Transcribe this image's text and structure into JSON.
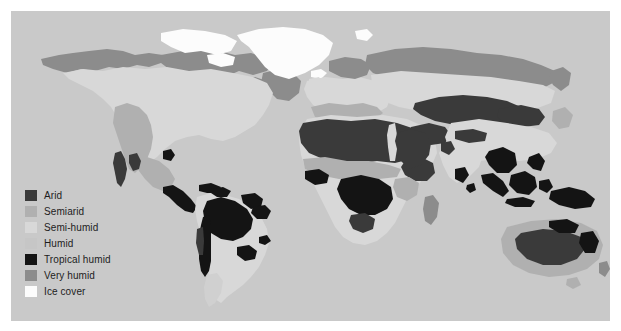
{
  "figure": {
    "kind": "world-climate-aridity-map",
    "projection": "equirectangular",
    "background_color": "#ffffff",
    "ocean_color": "#c9c9c9",
    "width": 621,
    "height": 331
  },
  "legend": {
    "title": "",
    "position": "bottom-left",
    "items": [
      {
        "label": "Arid",
        "color": "#3a3a3a"
      },
      {
        "label": "Semiarid",
        "color": "#b0b0b0"
      },
      {
        "label": "Semi-humid",
        "color": "#d8d8d8"
      },
      {
        "label": "Humid",
        "color": "#c6c6c6"
      },
      {
        "label": "Tropical humid",
        "color": "#141414"
      },
      {
        "label": "Very humid",
        "color": "#8c8c8c"
      },
      {
        "label": "Ice cover",
        "color": "#fcfcfc"
      }
    ]
  },
  "map_regions": [
    {
      "name": "greenland-ice-cover",
      "class_label": "Ice cover",
      "color": "#fcfcfc"
    },
    {
      "name": "arctic-archipelago-ice",
      "class_label": "Ice cover",
      "color": "#fcfcfc"
    },
    {
      "name": "siberian-tundra-belt",
      "class_label": "Very humid",
      "color": "#8c8c8c"
    },
    {
      "name": "canadian-tundra-belt",
      "class_label": "Very humid",
      "color": "#8c8c8c"
    },
    {
      "name": "alaska-boreal",
      "class_label": "Very humid",
      "color": "#8c8c8c"
    },
    {
      "name": "north-america-interior",
      "class_label": "Semi-humid",
      "color": "#d8d8d8"
    },
    {
      "name": "great-basin-southwest-arid",
      "class_label": "Semiarid",
      "color": "#b0b0b0"
    },
    {
      "name": "baja-california-arid",
      "class_label": "Arid",
      "color": "#3a3a3a"
    },
    {
      "name": "central-america-tropical",
      "class_label": "Tropical humid",
      "color": "#141414"
    },
    {
      "name": "amazon-basin",
      "class_label": "Tropical humid",
      "color": "#141414"
    },
    {
      "name": "guiana-tropical",
      "class_label": "Tropical humid",
      "color": "#141414"
    },
    {
      "name": "atacama-andes-arid",
      "class_label": "Arid",
      "color": "#3a3a3a"
    },
    {
      "name": "brazil-southeast",
      "class_label": "Semi-humid",
      "color": "#d8d8d8"
    },
    {
      "name": "patagonia-semiarid",
      "class_label": "Semi-humid",
      "color": "#d8d8d8"
    },
    {
      "name": "sahara-desert",
      "class_label": "Arid",
      "color": "#3a3a3a"
    },
    {
      "name": "nile-valley",
      "class_label": "Semi-humid",
      "color": "#d8d8d8"
    },
    {
      "name": "arabian-peninsula-arid",
      "class_label": "Arid",
      "color": "#3a3a3a"
    },
    {
      "name": "congo-basin-tropical",
      "class_label": "Tropical humid",
      "color": "#141414"
    },
    {
      "name": "west-africa-tropical",
      "class_label": "Tropical humid",
      "color": "#141414"
    },
    {
      "name": "horn-of-africa-arid",
      "class_label": "Arid",
      "color": "#3a3a3a"
    },
    {
      "name": "kalahari-namib-arid",
      "class_label": "Arid",
      "color": "#3a3a3a"
    },
    {
      "name": "southern-africa-semihumid",
      "class_label": "Semi-humid",
      "color": "#d8d8d8"
    },
    {
      "name": "europe-humid",
      "class_label": "Semi-humid",
      "color": "#d8d8d8"
    },
    {
      "name": "central-asia-arid",
      "class_label": "Arid",
      "color": "#3a3a3a"
    },
    {
      "name": "gobi-taklamakan-arid",
      "class_label": "Arid",
      "color": "#3a3a3a"
    },
    {
      "name": "iran-plateau-arid",
      "class_label": "Arid",
      "color": "#3a3a3a"
    },
    {
      "name": "thar-desert-arid",
      "class_label": "Arid",
      "color": "#3a3a3a"
    },
    {
      "name": "india-semihumid",
      "class_label": "Semi-humid",
      "color": "#d8d8d8"
    },
    {
      "name": "southeast-asia-tropical",
      "class_label": "Tropical humid",
      "color": "#141414"
    },
    {
      "name": "borneo-tropical",
      "class_label": "Tropical humid",
      "color": "#141414"
    },
    {
      "name": "new-guinea-tropical",
      "class_label": "Tropical humid",
      "color": "#141414"
    },
    {
      "name": "australia-interior-arid",
      "class_label": "Arid",
      "color": "#3a3a3a"
    },
    {
      "name": "australia-margin-semiarid",
      "class_label": "Semiarid",
      "color": "#b0b0b0"
    },
    {
      "name": "new-zealand",
      "class_label": "Semi-humid",
      "color": "#d8d8d8"
    }
  ]
}
